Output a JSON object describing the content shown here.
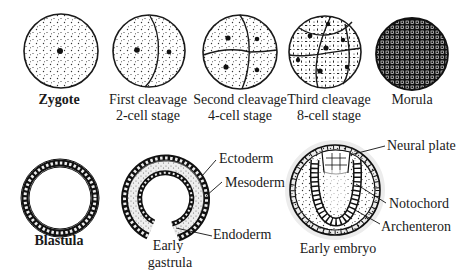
{
  "diagram": {
    "top_row": [
      {
        "id": "zygote",
        "label_lines": [
          "Zygote"
        ],
        "bold": true
      },
      {
        "id": "first-cleavage",
        "label_lines": [
          "First cleavage",
          "2-cell stage"
        ],
        "bold": false
      },
      {
        "id": "second-cleavage",
        "label_lines": [
          "Second cleavage",
          "4-cell stage"
        ],
        "bold": false
      },
      {
        "id": "third-cleavage",
        "label_lines": [
          "Third cleavage",
          "8-cell stage"
        ],
        "bold": false
      },
      {
        "id": "morula",
        "label_lines": [
          "Morula"
        ],
        "bold": false
      }
    ],
    "bottom_row": [
      {
        "id": "blastula",
        "label_lines": [
          "Blastula"
        ],
        "bold": true
      },
      {
        "id": "early-gastrula",
        "label_lines": [
          "Early",
          "gastrula"
        ],
        "bold": false,
        "callouts": [
          "Ectoderm",
          "Mesoderm",
          "Endoderm"
        ]
      },
      {
        "id": "early-embryo",
        "label_lines": [
          "Early embryo"
        ],
        "bold": false,
        "callouts": [
          "Neural plate",
          "Notochord",
          "Archenteron"
        ]
      }
    ]
  },
  "labels": {
    "zygote": "Zygote",
    "first_cleavage_1": "First cleavage",
    "first_cleavage_2": "2-cell stage",
    "second_cleavage_1": "Second cleavage",
    "second_cleavage_2": "4-cell stage",
    "third_cleavage_1": "Third cleavage",
    "third_cleavage_2": "8-cell stage",
    "morula": "Morula",
    "blastula": "Blastula",
    "gastrula_1": "Early",
    "gastrula_2": "gastrula",
    "ectoderm": "Ectoderm",
    "mesoderm": "Mesoderm",
    "endoderm": "Endoderm",
    "early_embryo": "Early embryo",
    "neural_plate": "Neural plate",
    "notochord": "Notochord",
    "archenteron": "Archenteron"
  },
  "colors": {
    "ink": "#1a1a1a",
    "background": "#ffffff",
    "stipple": "#333333"
  }
}
